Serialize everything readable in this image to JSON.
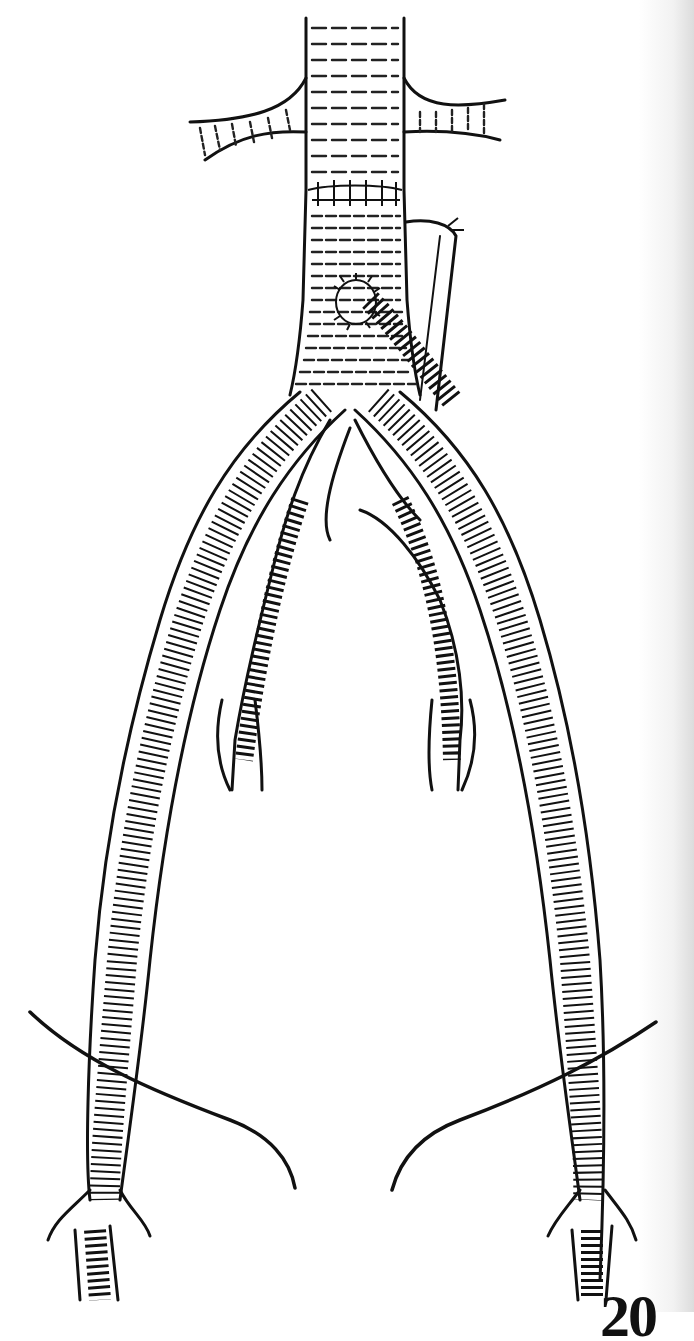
{
  "figure": {
    "elements": [
      "abdominal-aorta",
      "renal-arteries",
      "proximal-anastomosis-sutures",
      "bifurcated-graft",
      "inferior-mesenteric-reimplant",
      "left-graft-limb",
      "right-graft-limb",
      "internal-iliac-arteries",
      "inguinal-ligament-lines",
      "femoral-bifurcations"
    ]
  },
  "page": {
    "number_partial": "20"
  },
  "colors": {
    "ink": "#111111",
    "paper": "#ffffff"
  }
}
